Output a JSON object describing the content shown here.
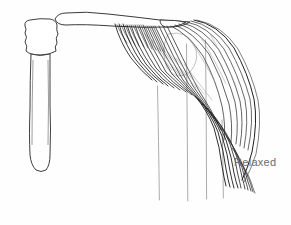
{
  "figure": {
    "name": "relaxed-deltoid-muscle-diagram",
    "width": 291,
    "height": 225,
    "background_color": "#fefefe",
    "style": "anatomical pen-and-ink line drawing"
  },
  "labels": [
    {
      "id": "relaxed-label",
      "text": "Relaxed",
      "color": "#6b6b6b",
      "x": 234,
      "y": 156,
      "font_size": 11
    }
  ],
  "colors": {
    "ink": "#1a1a1a",
    "bone_outline": "#4a4a4a",
    "guide_line": "#7a7a7a",
    "fiber_dark": "#141414",
    "fiber_mid": "#3c3c3c",
    "fiber_light": "#808080",
    "label_gray": "#6b6b6b",
    "paper": "#fefefe"
  },
  "parts": [
    {
      "id": "humerus-shaft",
      "name": "humerus-shaft",
      "description": "vertical long bone shaft on left side, rounded distal tip"
    },
    {
      "id": "humerus-head",
      "name": "humerus-head",
      "description": "irregular rounded proximal head of humerus at top of shaft"
    },
    {
      "id": "clavicle-bone",
      "name": "clavicle-bone",
      "description": "horizontal elongated bone running left to right across top"
    },
    {
      "id": "deltoid-muscle",
      "name": "deltoid-muscle-fibers",
      "description": "fan of curved muscle fibers radiating from clavicle origin, converging into tendon at lower right",
      "fiber_count": 26
    },
    {
      "id": "tendon-insertion",
      "name": "tendon-insertion",
      "description": "narrow converged tendon bundle hooking down at lower right"
    },
    {
      "id": "guide-lines",
      "name": "vertical-guide-lines",
      "description": "four faint thin vertical construction lines descending below the muscle",
      "x_positions": [
        158,
        187,
        206,
        223
      ]
    },
    {
      "id": "contour-oval",
      "name": "faint-contour-oval",
      "description": "faint oval construction outline within muscle belly"
    }
  ]
}
